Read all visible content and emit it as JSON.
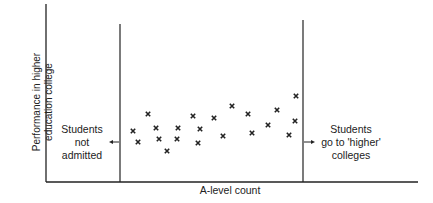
{
  "chart_data": {
    "type": "scatter",
    "title": "",
    "xlabel": "A-level count",
    "ylabel": "Performance in higher education college",
    "ylabel_lines": [
      "Performance in higher",
      "education college"
    ],
    "grid": false,
    "legend": null,
    "marker": "x",
    "axis_ticks": "none",
    "annotations": [
      {
        "text": "Students not admitted",
        "lines": [
          "Students",
          "not",
          "admitted"
        ],
        "position": "left of lower cutoff line",
        "arrow": "pointing left"
      },
      {
        "text": "Students go to 'higher' colleges",
        "lines": [
          "Students",
          "go to 'higher'",
          "colleges"
        ],
        "position": "right of upper cutoff line",
        "arrow": "pointing right"
      }
    ],
    "cutoff_lines": [
      {
        "name": "lower-cutoff",
        "x_px": 120
      },
      {
        "name": "upper-cutoff",
        "x_px": 303
      }
    ],
    "points_px": [
      [
        133,
        131
      ],
      [
        138,
        142
      ],
      [
        148,
        114
      ],
      [
        156,
        128
      ],
      [
        159,
        139
      ],
      [
        167,
        151
      ],
      [
        178,
        128
      ],
      [
        177,
        139
      ],
      [
        193,
        116
      ],
      [
        200,
        129
      ],
      [
        198,
        143
      ],
      [
        214,
        118
      ],
      [
        223,
        136
      ],
      [
        232,
        106
      ],
      [
        248,
        114
      ],
      [
        252,
        133
      ],
      [
        268,
        125
      ],
      [
        277,
        110
      ],
      [
        289,
        135
      ],
      [
        295,
        121
      ],
      [
        296,
        96
      ]
    ]
  }
}
